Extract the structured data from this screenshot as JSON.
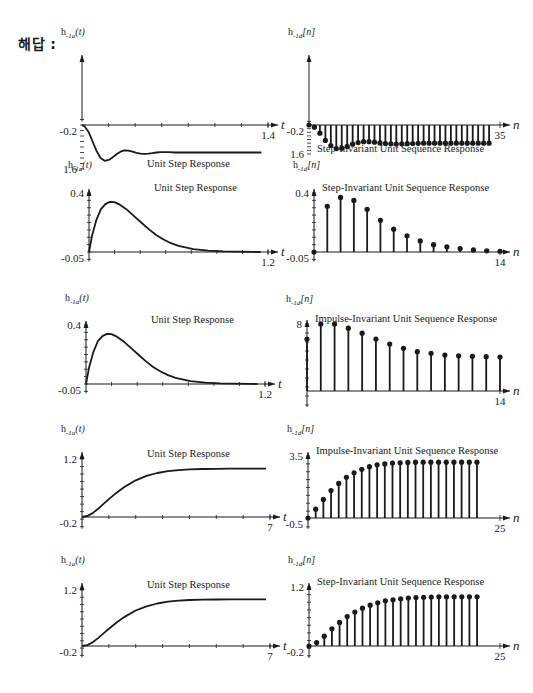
{
  "header": {
    "answer_label": "해답 :"
  },
  "chart_data": [
    {
      "id": "r1-left",
      "type": "line",
      "title": "Unit Step Response",
      "ylabel_main": "h",
      "ylabel_sub": "-1a",
      "ylabel_arg": "(t)",
      "xlabel": "t",
      "y_top_label": "1.6",
      "y_bottom_label": "-0.2",
      "x_end_label": "1.4",
      "xlim": [
        0,
        1.4
      ],
      "ylim": [
        -0.2,
        1.6
      ],
      "x": [
        0,
        0.02,
        0.05,
        0.08,
        0.11,
        0.14,
        0.17,
        0.2,
        0.23,
        0.26,
        0.29,
        0.32,
        0.35,
        0.38,
        0.41,
        0.44,
        0.47,
        0.5,
        0.53,
        0.56,
        0.59,
        0.62,
        0.65,
        0.7,
        0.75,
        0.8,
        0.9,
        1.0,
        1.1,
        1.2,
        1.3,
        1.35
      ],
      "y": [
        0,
        0.05,
        0.25,
        0.6,
        0.95,
        1.2,
        1.3,
        1.27,
        1.18,
        1.06,
        0.97,
        0.92,
        0.93,
        0.97,
        1.01,
        1.04,
        1.05,
        1.04,
        1.02,
        1.0,
        0.99,
        0.99,
        0.99,
        1.0,
        1.0,
        1.0,
        1.0,
        1.0,
        1.0,
        1.0,
        1.0,
        1.0
      ]
    },
    {
      "id": "r1-right",
      "type": "stem",
      "title": "Step-Invariant Unit Sequence Response",
      "ylabel_main": "h",
      "ylabel_sub": "-1d",
      "ylabel_arg": "[n]",
      "xlabel": "n",
      "y_top_label": "1.6",
      "y_bottom_label": "-0.2",
      "x_end_label": "35",
      "xlim": [
        0,
        35
      ],
      "ylim": [
        -0.2,
        1.6
      ],
      "values": [
        0,
        0.12,
        0.45,
        0.85,
        1.13,
        1.3,
        1.28,
        1.18,
        1.06,
        0.97,
        0.92,
        0.92,
        0.95,
        0.99,
        1.02,
        1.04,
        1.05,
        1.04,
        1.03,
        1.02,
        1.01,
        1.0,
        1.0,
        1.0,
        1.0,
        1.0,
        1.0,
        1.0,
        1.0,
        1.0,
        1.0,
        1.0,
        1.0,
        1.0
      ]
    },
    {
      "id": "r2-left",
      "type": "line",
      "title": "Unit Step Response",
      "ylabel_main": "h",
      "ylabel_sub": "-1a",
      "ylabel_arg": "(t)",
      "xlabel": "t",
      "y_top_label": "0.4",
      "y_bottom_label": "-0.05",
      "x_end_label": "1.2",
      "xlim": [
        0,
        1.2
      ],
      "ylim": [
        -0.05,
        0.4
      ],
      "x": [
        0,
        0.02,
        0.05,
        0.08,
        0.11,
        0.14,
        0.17,
        0.2,
        0.25,
        0.3,
        0.35,
        0.4,
        0.45,
        0.5,
        0.55,
        0.6,
        0.7,
        0.8,
        0.9,
        1.0,
        1.1,
        1.15
      ],
      "y": [
        0,
        0.11,
        0.22,
        0.29,
        0.325,
        0.34,
        0.338,
        0.325,
        0.29,
        0.245,
        0.2,
        0.155,
        0.115,
        0.085,
        0.06,
        0.042,
        0.02,
        0.009,
        0.004,
        0.002,
        0.001,
        0.0
      ]
    },
    {
      "id": "r2-right",
      "type": "stem",
      "title": "Step-Invariant Unit Sequence Response",
      "ylabel_main": "h",
      "ylabel_sub": "-1d",
      "ylabel_arg": "[n]",
      "xlabel": "n",
      "y_top_label": "0.4",
      "y_bottom_label": "-0.05",
      "x_end_label": "14",
      "xlim": [
        0,
        14
      ],
      "ylim": [
        -0.05,
        0.4
      ],
      "values": [
        0,
        0.31,
        0.37,
        0.35,
        0.29,
        0.215,
        0.155,
        0.11,
        0.075,
        0.05,
        0.035,
        0.023,
        0.014,
        0.008,
        0.005
      ]
    },
    {
      "id": "r3-left",
      "type": "line",
      "title": "Unit Step Response",
      "ylabel_main": "h",
      "ylabel_sub": "-1a",
      "ylabel_arg": "(t)",
      "xlabel": "t",
      "y_top_label": "0.4",
      "y_bottom_label": "-0.05",
      "x_end_label": "1.2",
      "xlim": [
        0,
        1.2
      ],
      "ylim": [
        -0.05,
        0.4
      ],
      "x": [
        0,
        0.02,
        0.05,
        0.08,
        0.11,
        0.14,
        0.17,
        0.2,
        0.25,
        0.3,
        0.35,
        0.4,
        0.45,
        0.5,
        0.55,
        0.6,
        0.7,
        0.8,
        0.9,
        1.0,
        1.1,
        1.15
      ],
      "y": [
        0,
        0.11,
        0.22,
        0.29,
        0.325,
        0.34,
        0.338,
        0.325,
        0.29,
        0.245,
        0.2,
        0.155,
        0.115,
        0.085,
        0.06,
        0.042,
        0.02,
        0.009,
        0.004,
        0.002,
        0.001,
        0.0
      ]
    },
    {
      "id": "r3-right",
      "type": "stem",
      "title": "Impulse-Invariant Unit Sequence Response",
      "ylabel_main": "h",
      "ylabel_sub": "-1d",
      "ylabel_arg": "[n]",
      "xlabel": "n",
      "y_top_label": "8",
      "y_bottom_label": "",
      "x_end_label": "14",
      "xlim": [
        0,
        14
      ],
      "ylim": [
        0,
        8
      ],
      "values": [
        6.2,
        8.0,
        8.0,
        7.5,
        6.9,
        6.2,
        5.6,
        5.1,
        4.7,
        4.5,
        4.3,
        4.2,
        4.15,
        4.1,
        4.05
      ]
    },
    {
      "id": "r4-left",
      "type": "line",
      "title": "Unit Step Response",
      "ylabel_main": "h",
      "ylabel_sub": "-1a",
      "ylabel_arg": "(t)",
      "xlabel": "t",
      "y_top_label": "1.2",
      "y_bottom_label": "-0.2",
      "x_end_label": "7",
      "xlim": [
        0,
        7
      ],
      "ylim": [
        -0.2,
        1.2
      ],
      "x": [
        0,
        0.2,
        0.4,
        0.6,
        0.8,
        1.0,
        1.3,
        1.6,
        2.0,
        2.4,
        2.8,
        3.2,
        3.6,
        4.0,
        4.5,
        5.0,
        5.5,
        6.0,
        6.5,
        6.85
      ],
      "y": [
        0,
        0.02,
        0.08,
        0.17,
        0.27,
        0.37,
        0.51,
        0.63,
        0.76,
        0.85,
        0.91,
        0.95,
        0.97,
        0.985,
        0.993,
        0.997,
        0.999,
        1.0,
        1.0,
        1.0
      ]
    },
    {
      "id": "r4-right",
      "type": "stem",
      "title": "Impulse-Invariant Unit Sequence Response",
      "ylabel_main": "h",
      "ylabel_sub": "-1d",
      "ylabel_arg": "[n]",
      "xlabel": "n",
      "y_top_label": "3.5",
      "y_bottom_label": "-0.5",
      "x_end_label": "25",
      "xlim": [
        0,
        25
      ],
      "ylim": [
        -0.5,
        3.5
      ],
      "values": [
        0,
        0.5,
        1.05,
        1.55,
        1.95,
        2.3,
        2.55,
        2.75,
        2.9,
        3.0,
        3.05,
        3.1,
        3.12,
        3.14,
        3.15,
        3.15,
        3.15,
        3.15,
        3.15,
        3.15,
        3.15,
        3.15,
        3.15
      ]
    },
    {
      "id": "r5-left",
      "type": "line",
      "title": "Unit Step Response",
      "ylabel_main": "h",
      "ylabel_sub": "-1a",
      "ylabel_arg": "(t)",
      "xlabel": "t",
      "y_top_label": "1.2",
      "y_bottom_label": "-0.2",
      "x_end_label": "7",
      "xlim": [
        0,
        7
      ],
      "ylim": [
        -0.2,
        1.2
      ],
      "x": [
        0,
        0.2,
        0.4,
        0.6,
        0.8,
        1.0,
        1.3,
        1.6,
        2.0,
        2.4,
        2.8,
        3.2,
        3.6,
        4.0,
        4.5,
        5.0,
        5.5,
        6.0,
        6.5,
        6.85
      ],
      "y": [
        0,
        0.02,
        0.08,
        0.17,
        0.27,
        0.37,
        0.51,
        0.63,
        0.76,
        0.85,
        0.91,
        0.95,
        0.97,
        0.985,
        0.993,
        0.997,
        0.999,
        1.0,
        1.0,
        1.0
      ]
    },
    {
      "id": "r5-right",
      "type": "stem",
      "title": "Step-Invariant Unit Sequence Response",
      "ylabel_main": "h",
      "ylabel_sub": "-1d",
      "ylabel_arg": "[n]",
      "xlabel": "n",
      "y_top_label": "1.2",
      "y_bottom_label": "-0.2",
      "x_end_label": "25",
      "xlim": [
        0,
        25
      ],
      "ylim": [
        -0.2,
        1.2
      ],
      "values": [
        0,
        0.07,
        0.2,
        0.35,
        0.48,
        0.6,
        0.69,
        0.77,
        0.83,
        0.88,
        0.92,
        0.94,
        0.96,
        0.975,
        0.985,
        0.99,
        0.995,
        1.0,
        1.0,
        1.0,
        1.0,
        1.0,
        1.0
      ]
    }
  ]
}
